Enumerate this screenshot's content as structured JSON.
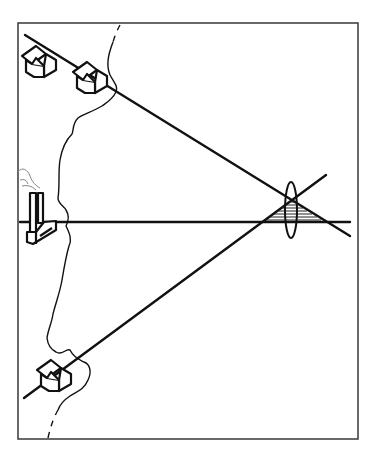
{
  "diagram": {
    "elements": {
      "frame": "rectangular border",
      "coastline": "wavy vertical coastline, dashed at top and bottom",
      "houses": [
        {
          "name": "house-top-left",
          "position": "top-left"
        },
        {
          "name": "house-top-middle",
          "position": "top, near coast"
        },
        {
          "name": "house-bottom",
          "position": "bottom-left, on coast"
        }
      ],
      "factory": {
        "name": "factory-with-chimney",
        "position": "middle-left",
        "emits": "smoke"
      },
      "lines": [
        {
          "name": "line-from-top-houses",
          "direction": "descending to right"
        },
        {
          "name": "line-from-factory",
          "direction": "horizontal"
        },
        {
          "name": "line-from-bottom-house",
          "direction": "ascending to right"
        }
      ],
      "lens": {
        "name": "vertical-lens",
        "shape": "ellipse"
      },
      "hatched_region": {
        "name": "hatched-triangle",
        "shape": "triangle between converging lines"
      }
    },
    "colors": {
      "ink": "#111111",
      "frame": "#444444",
      "background": "#ffffff"
    }
  }
}
